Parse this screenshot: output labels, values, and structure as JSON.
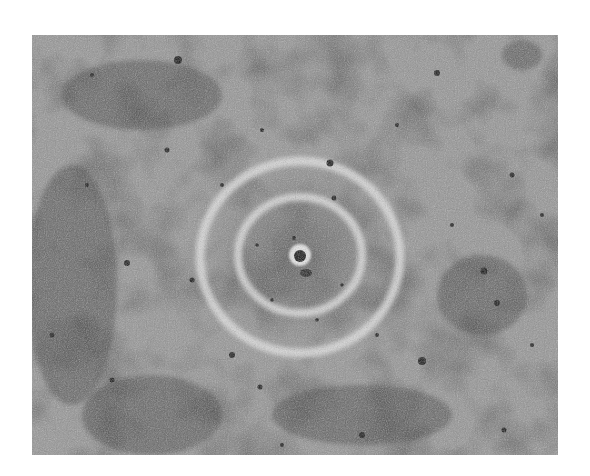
{
  "image": {
    "description": "Grayscale photograph of a textured, pitted surface with concentric light rings around a central dark pit",
    "palette": {
      "base": "#8f8f8f",
      "dark": "#2a2a2a",
      "mid": "#6b6b6b",
      "light": "#d8d8d8",
      "background": "#ffffff"
    },
    "rings": {
      "center_x": 268,
      "center_y": 220,
      "inner_radius": 60,
      "outer_radius": 100
    }
  }
}
